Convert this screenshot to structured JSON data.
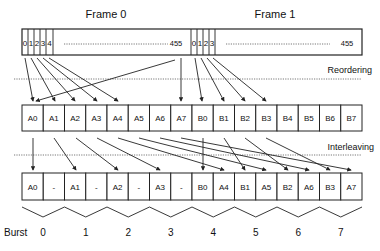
{
  "frames": [
    {
      "title": "Frame 0",
      "bits": [
        "0",
        "1",
        "2",
        "3",
        "4"
      ],
      "ellipsis": "........................................",
      "last": "455"
    },
    {
      "title": "Frame 1",
      "bits": [
        "0",
        "1",
        "2",
        "3"
      ],
      "ellipsis": "........................................",
      "last": "455"
    }
  ],
  "stages": {
    "reordering": "Reordering",
    "interleaving": "Interleaving"
  },
  "reordered_blocks": [
    "A0",
    "A1",
    "A2",
    "A3",
    "A4",
    "A5",
    "A6",
    "A7",
    "B0",
    "B1",
    "B2",
    "B3",
    "B4",
    "B5",
    "B6",
    "B7"
  ],
  "interleaved_blocks": [
    "A0",
    "-",
    "A1",
    "-",
    "A2",
    "-",
    "A3",
    "-",
    "B0",
    "A4",
    "B1",
    "A5",
    "B2",
    "A6",
    "B3",
    "A7"
  ],
  "burst": {
    "label": "Burst",
    "numbers": [
      "0",
      "1",
      "2",
      "3",
      "4",
      "5",
      "6",
      "7"
    ]
  }
}
